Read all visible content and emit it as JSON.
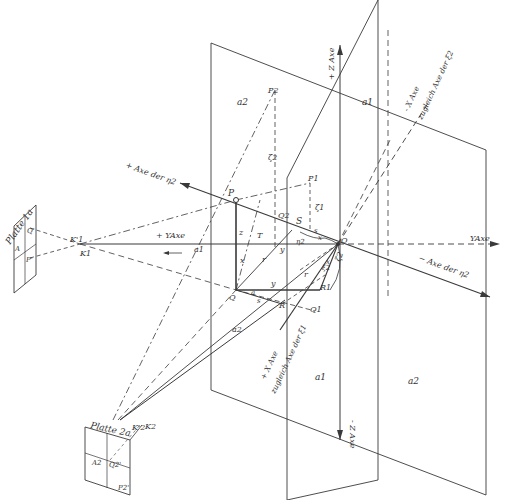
{
  "diagram": {
    "colors": {
      "background": "#ffffff",
      "ink": "#3a3a3a"
    },
    "plates": {
      "plate1": {
        "title": "Platte 1a",
        "labels": {
          "q": "Q'",
          "a": "A",
          "p": "P'"
        }
      },
      "plate2": {
        "title": "Platte 2a",
        "labels": {
          "a": "A2",
          "q": "Q2'",
          "p": "P2'"
        }
      }
    },
    "points": {
      "K1prime": "K'1",
      "K1": "K1",
      "K2prime": "K'2",
      "K2": "K2",
      "P": "P",
      "P1": "P1",
      "P2": "P2",
      "Q": "Q",
      "Q1": "Q1",
      "Q2": "Q2",
      "R": "R",
      "R1": "R1",
      "S": "S",
      "T": "T",
      "O": "O",
      "eta2": "η2"
    },
    "segments": {
      "z": "z",
      "x": "x",
      "y_upper": "y",
      "y_lower": "y",
      "r_upper": "r",
      "r_lower": "r",
      "s_upper": "s",
      "s_lower": "s",
      "a_lower": "a",
      "x_right": "x",
      "x_upper_s": "x",
      "xi1": "ξ1",
      "xi2": "ξ2",
      "zeta1": "ζ1",
      "zeta2": "ζ2",
      "xi_lower": "ξ1"
    },
    "planes": {
      "a1_top": "a1",
      "a2_top": "a2",
      "a1_axis": "a1",
      "a1_bottom": "a1",
      "a2_bottom": "a2",
      "a2_left": "a2"
    },
    "axes": {
      "plus_z": "+ Z Axe",
      "minus_z": "- Z Axe",
      "plus_y": "+ YAxe",
      "y_right": "YAxe",
      "minus_x": "- X Axe",
      "minus_x_sub": "zugleich Axe der ξ2",
      "plus_x": "+ X Axe",
      "plus_x_sub": "zugleich Axe der ξ1",
      "plus_eta": "+ Axe der η2",
      "minus_eta": "− Axe der η2"
    }
  }
}
